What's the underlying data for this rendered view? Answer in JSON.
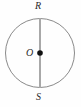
{
  "figure": {
    "type": "circle-with-diameter",
    "background_color": "#fefefe",
    "labels": {
      "top": "R",
      "bottom": "S",
      "center": "O"
    },
    "circle": {
      "center_x": 40,
      "center_y": 53,
      "radius": 35,
      "stroke_color": "#8a8a8a",
      "stroke_width": 1,
      "fill": "none"
    },
    "diameter": {
      "from": "R",
      "to": "S",
      "x": 40,
      "y1": 18,
      "y2": 88,
      "stroke_color": "#a8a8a8",
      "stroke_width": 2
    },
    "center_point": {
      "label": "O",
      "x": 40,
      "y": 53,
      "radius": 3,
      "fill_color": "#111111"
    }
  },
  "chart_data": {
    "type": "diagram",
    "title": "",
    "points": [
      {
        "name": "R",
        "x": 40,
        "y": 18,
        "role": "top-endpoint-of-diameter"
      },
      {
        "name": "O",
        "x": 40,
        "y": 53,
        "role": "center"
      },
      {
        "name": "S",
        "x": 40,
        "y": 88,
        "role": "bottom-endpoint-of-diameter"
      }
    ],
    "segments": [
      {
        "name": "RS",
        "from": "R",
        "to": "S",
        "role": "diameter"
      }
    ],
    "shapes": [
      {
        "type": "circle",
        "center": "O",
        "radius": 35
      }
    ]
  }
}
